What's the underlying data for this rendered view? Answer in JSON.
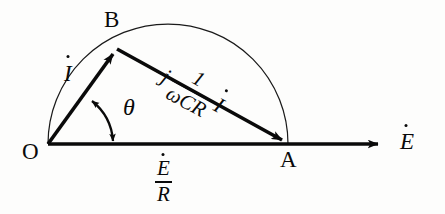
{
  "figure": {
    "kind": "phasor-diagram",
    "title": "",
    "background_color": "#fdfdfc",
    "ink_color": "#0a0a0a",
    "width": 445,
    "height": 214
  },
  "points": {
    "origin": {
      "label": "O",
      "x": 48,
      "y": 144
    },
    "apex": {
      "label": "B",
      "x": 116,
      "y": 48
    },
    "foot": {
      "label": "A",
      "x": 288,
      "y": 144
    }
  },
  "axis": {
    "label_text": "E",
    "label_accent": "dot",
    "arrow_tip_x": 386,
    "arrow_tail_x": 48,
    "y": 144
  },
  "vectors": {
    "current": {
      "label_text": "I",
      "label_accent": "dot",
      "from": "origin",
      "to": "apex"
    },
    "capacitive": {
      "prefix": "−j",
      "numerator": "1",
      "denominator": "ωCR",
      "suffix_text": "I",
      "suffix_accent": "dot",
      "from": "apex",
      "to": "foot"
    },
    "resistive": {
      "numerator": "E",
      "numerator_accent": "dot",
      "denominator": "R",
      "from": "origin",
      "to": "foot"
    }
  },
  "angle": {
    "symbol": "θ",
    "between": [
      "current",
      "axis"
    ]
  },
  "arc": {
    "description": "semicircle-on-OA-through-B",
    "center_x": 168,
    "center_y": 144,
    "radius": 120
  }
}
